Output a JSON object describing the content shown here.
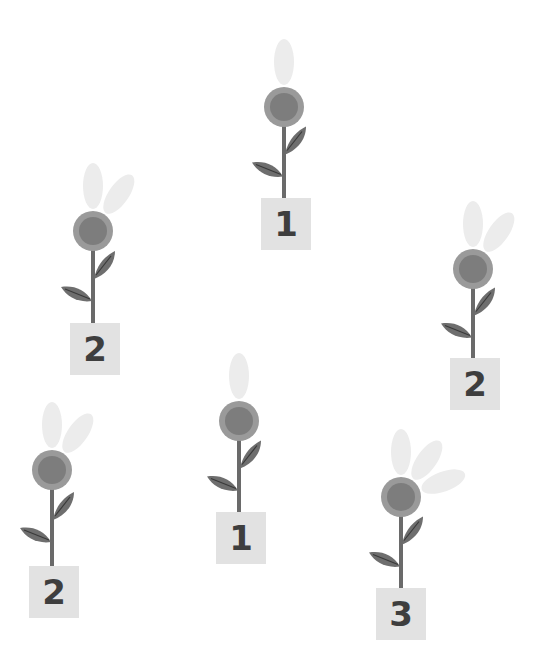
{
  "scene": {
    "description": "Six flowers, each with a numbered sign; number of faded petals equals sign number",
    "colors": {
      "background": "#ffffff",
      "petal": "#ececec",
      "head_outer": "#9a9a9a",
      "head_inner": "#7d7d7d",
      "stem": "#6a6a6a",
      "leaf": "#6e6e6e",
      "leaf_vein": "#3a3a3a",
      "sign_bg": "#e2e2e2",
      "sign_text": "#3e3e3e"
    }
  },
  "flowers": [
    {
      "id": 1,
      "label": "1",
      "petals": 1,
      "head": {
        "x": 284,
        "y": 107
      },
      "sign": {
        "x": 261,
        "y": 198
      }
    },
    {
      "id": 2,
      "label": "2",
      "petals": 2,
      "head": {
        "x": 93,
        "y": 231
      },
      "sign": {
        "x": 70,
        "y": 323
      }
    },
    {
      "id": 3,
      "label": "2",
      "petals": 2,
      "head": {
        "x": 473,
        "y": 269
      },
      "sign": {
        "x": 450,
        "y": 358
      }
    },
    {
      "id": 4,
      "label": "1",
      "petals": 1,
      "head": {
        "x": 239,
        "y": 421
      },
      "sign": {
        "x": 216,
        "y": 512
      }
    },
    {
      "id": 5,
      "label": "2",
      "petals": 2,
      "head": {
        "x": 52,
        "y": 470
      },
      "sign": {
        "x": 29,
        "y": 566
      }
    },
    {
      "id": 6,
      "label": "3",
      "petals": 3,
      "head": {
        "x": 401,
        "y": 497
      },
      "sign": {
        "x": 376,
        "y": 588
      }
    }
  ]
}
